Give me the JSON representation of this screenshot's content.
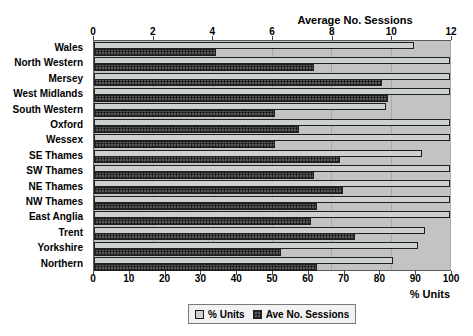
{
  "chart_data": {
    "type": "bar",
    "orientation": "horizontal",
    "grid": true,
    "categories": [
      "Wales",
      "North Western",
      "Mersey",
      "West Midlands",
      "South Western",
      "Oxford",
      "Wessex",
      "SE Thames",
      "SW Thames",
      "NE Thames",
      "NW Thames",
      "East Anglia",
      "Trent",
      "Yorkshire",
      "Northern"
    ],
    "series": [
      {
        "name": "% Units",
        "axis": "bottom",
        "color": "#cdd1cd",
        "values": [
          90,
          100,
          100,
          100,
          82,
          100,
          100,
          92,
          100,
          100,
          100,
          100,
          93,
          91,
          84
        ]
      },
      {
        "name": "Ave No. Sessions",
        "axis": "top",
        "color": "#585858",
        "values": [
          4.1,
          7.4,
          9.7,
          9.9,
          6.1,
          6.9,
          6.1,
          8.3,
          7.4,
          8.4,
          7.5,
          7.3,
          8.8,
          6.3,
          7.5
        ]
      }
    ],
    "top_axis": {
      "label": "Average No. Sessions",
      "min": 0,
      "max": 12,
      "ticks": [
        0,
        2,
        4,
        6,
        8,
        10,
        12
      ]
    },
    "bottom_axis": {
      "label": "% Units",
      "min": 0,
      "max": 100,
      "ticks": [
        0,
        10,
        20,
        30,
        40,
        50,
        60,
        70,
        80,
        90,
        100
      ]
    },
    "legend": [
      {
        "label": "% Units",
        "swatch": "light-gray-square"
      },
      {
        "label": "Ave No. Sessions",
        "swatch": "dark-crosshatch-square"
      }
    ],
    "legend_position": "bottom-center",
    "plot_background": "#c3c3c3",
    "gridline_color": "#a9a9a9"
  }
}
